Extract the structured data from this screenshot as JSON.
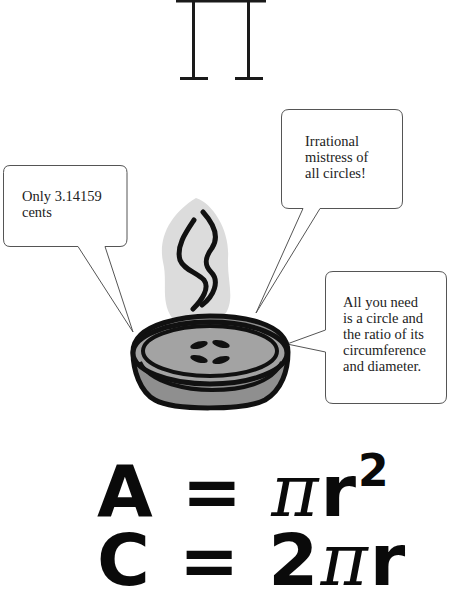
{
  "illustration": {
    "title_symbol": "π",
    "bubbles": [
      {
        "id": "left",
        "text": "Only 3.14159\ncents"
      },
      {
        "id": "top-right",
        "text": "Irrational\nmistress of\nall circles!"
      },
      {
        "id": "right",
        "text": "All you need\nis a circle and\nthe ratio of its\ncircumference\nand diameter."
      }
    ],
    "center_image": "steaming pie",
    "colors": {
      "ink": "#111111",
      "pie_fill": "#9a9a9a",
      "steam_bg": "#d9d9d9",
      "bubble_stroke": "#555555"
    }
  },
  "formulas": {
    "area": {
      "lhs": "A",
      "eq": "=",
      "pi": "π",
      "rest": "r",
      "exp": "2"
    },
    "circumference": {
      "lhs": "C",
      "eq": "=",
      "coef": "2",
      "pi": "π",
      "rest": "r"
    }
  }
}
